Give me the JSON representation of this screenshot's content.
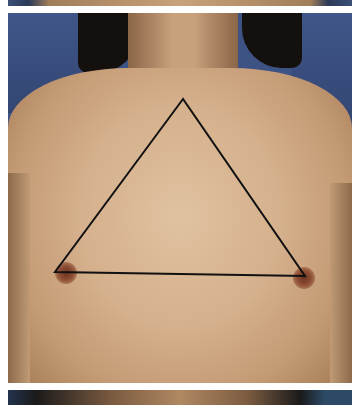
{
  "image": {
    "description": "Clinical front-view photograph of a torso with a black triangle overlay connecting the sternal notch and both nipples",
    "panels": [
      "top-strip",
      "main-photo",
      "bottom-strip"
    ]
  },
  "overlay": {
    "shape": "triangle",
    "stroke_color": "#111111",
    "stroke_width": 2,
    "points": {
      "apex": [
        183,
        99
      ],
      "left": [
        55,
        272
      ],
      "right": [
        305,
        276
      ]
    }
  },
  "colors": {
    "background": "#ffffff",
    "backdrop_blue": "#3d5383",
    "skin": "#d5b08c",
    "areola": "#8e4e34",
    "hair": "#14100e"
  }
}
